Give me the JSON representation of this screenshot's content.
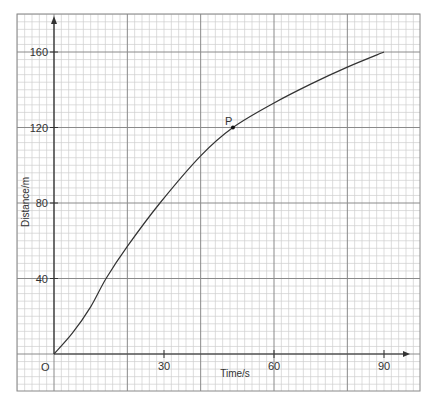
{
  "chart_data": {
    "type": "line",
    "title": "",
    "xlabel": "Time/s",
    "ylabel": "Distance/m",
    "origin_label": "O",
    "xlim": [
      -10,
      100
    ],
    "ylim": [
      -20,
      180
    ],
    "x_ticks": [
      30,
      60,
      90
    ],
    "y_ticks": [
      40,
      80,
      120,
      160
    ],
    "grid": {
      "on": true,
      "minor_x_step": 2,
      "major_x_step": 20,
      "minor_y_step": 4,
      "major_y_step": 40
    },
    "series": [
      {
        "name": "distance-time curve",
        "x": [
          0,
          5,
          10,
          14.2,
          20,
          28.9,
          40,
          48.8,
          60,
          70,
          80,
          90
        ],
        "y": [
          0,
          11,
          25,
          40,
          57,
          80,
          105,
          120,
          133,
          143,
          152,
          160
        ]
      }
    ],
    "annotations": [
      {
        "label": "P",
        "x": 48.8,
        "y": 120
      }
    ]
  }
}
